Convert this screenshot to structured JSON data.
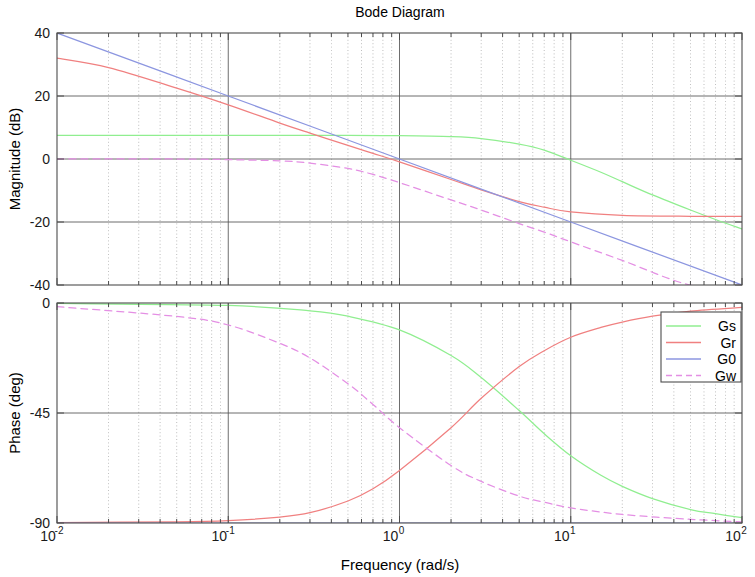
{
  "figure": {
    "title": "Bode Diagram",
    "width": 755,
    "height": 577,
    "background": "#ffffff"
  },
  "xaxis": {
    "label": "Frequency  (rad/s)",
    "scale": "log",
    "min": 0.01,
    "max": 100,
    "tick_mantissas": [
      "10",
      "10",
      "10",
      "10",
      "10"
    ],
    "tick_exponents": [
      "-2",
      "-1",
      "0",
      "1",
      "2"
    ],
    "tick_values": [
      0.01,
      0.1,
      1,
      10,
      100
    ],
    "grid": "on"
  },
  "panels": {
    "magnitude": {
      "ylabel": "Magnitude (dB)",
      "ymin": -40,
      "ymax": 40,
      "yticks": [
        "40",
        "20",
        "0",
        "-20",
        "-40"
      ],
      "ytick_values": [
        40,
        20,
        0,
        -20,
        -40
      ]
    },
    "phase": {
      "ylabel": "Phase (deg)",
      "ymin": -90,
      "ymax": 0,
      "yticks": [
        "0",
        "-45",
        "-90"
      ],
      "ytick_values": [
        0,
        -45,
        -90
      ]
    }
  },
  "legend": {
    "position": "top-right-of-phase-panel",
    "entries": [
      {
        "label": "Gs",
        "color": "#90ee90",
        "style": "solid"
      },
      {
        "label": "Gr",
        "color": "#f08080",
        "style": "solid"
      },
      {
        "label": "G0",
        "color": "#8c96e0",
        "style": "solid"
      },
      {
        "label": "Gw",
        "color": "#e48fe4",
        "style": "dashed"
      }
    ]
  },
  "chart_data": {
    "type": "line",
    "title": "Bode Diagram",
    "xlabel": "Frequency  (rad/s)",
    "xscale": "log",
    "xlim": [
      0.01,
      100
    ],
    "grid": true,
    "legend_position": "upper right",
    "subplots": [
      {
        "name": "magnitude",
        "ylabel": "Magnitude (dB)",
        "ylim": [
          -40,
          40
        ],
        "yticks": [
          40,
          20,
          0,
          -20,
          -40
        ],
        "series": [
          {
            "name": "Gs",
            "color": "#90ee90",
            "style": "solid",
            "x": [
              0.01,
              0.02,
              0.05,
              0.1,
              0.2,
              0.5,
              1,
              2,
              3,
              5,
              7,
              10,
              15,
              20,
              30,
              50,
              70,
              100
            ],
            "y": [
              7.5,
              7.5,
              7.5,
              7.5,
              7.5,
              7.5,
              7.4,
              7.1,
              6.5,
              4.7,
              2.8,
              -0.4,
              -4.2,
              -7.2,
              -11.4,
              -16.2,
              -19.2,
              -22.2
            ]
          },
          {
            "name": "Gr",
            "color": "#f08080",
            "style": "solid",
            "x": [
              0.01,
              0.02,
              0.05,
              0.1,
              0.2,
              0.3,
              0.5,
              0.7,
              1,
              2,
              3,
              5,
              7,
              10,
              20,
              50,
              100
            ],
            "y": [
              32.0,
              29.0,
              22.5,
              17.2,
              11.4,
              8.2,
              4.3,
              1.8,
              -0.9,
              -6.5,
              -9.8,
              -13.5,
              -15.3,
              -16.8,
              -17.9,
              -18.2,
              -18.2
            ]
          },
          {
            "name": "G0",
            "color": "#8c96e0",
            "style": "solid",
            "x": [
              0.01,
              0.1,
              1,
              10,
              100
            ],
            "y": [
              40,
              20,
              0,
              -20,
              -40
            ]
          },
          {
            "name": "Gw",
            "color": "#e48fe4",
            "style": "dashed",
            "x": [
              0.01,
              0.05,
              0.1,
              0.2,
              0.3,
              0.5,
              0.7,
              1,
              2,
              3,
              5,
              7,
              10,
              20,
              50,
              100
            ],
            "y": [
              0.0,
              0.0,
              -0.2,
              -0.6,
              -1.3,
              -3.0,
              -4.9,
              -7.5,
              -13.0,
              -16.2,
              -20.5,
              -23.2,
              -26.3,
              -32.2,
              -40.0,
              -40.0
            ]
          }
        ]
      },
      {
        "name": "phase",
        "ylabel": "Phase (deg)",
        "ylim": [
          -90,
          0
        ],
        "yticks": [
          0,
          -45,
          -90
        ],
        "series": [
          {
            "name": "Gs",
            "color": "#90ee90",
            "style": "solid",
            "x": [
              0.01,
              0.1,
              0.3,
              0.5,
              1,
              2,
              3,
              5,
              7,
              10,
              15,
              20,
              30,
              50,
              70,
              100
            ],
            "y": [
              -0.2,
              -1.0,
              -3.2,
              -5.4,
              -11.0,
              -21.5,
              -30.5,
              -44.0,
              -53.5,
              -62.5,
              -70.5,
              -75.0,
              -80.0,
              -84.5,
              -86.2,
              -87.8
            ]
          },
          {
            "name": "Gr",
            "color": "#f08080",
            "style": "solid",
            "x": [
              0.01,
              0.05,
              0.1,
              0.2,
              0.3,
              0.5,
              0.7,
              1,
              2,
              3,
              5,
              7,
              10,
              15,
              20,
              30,
              50,
              100
            ],
            "y": [
              -89.8,
              -89.5,
              -89.0,
              -87.6,
              -85.8,
              -81.0,
              -76.0,
              -68.5,
              -51.0,
              -39.0,
              -26.0,
              -19.5,
              -14.0,
              -10.0,
              -7.8,
              -5.4,
              -3.3,
              -1.8
            ]
          },
          {
            "name": "G0",
            "color": "#8c96e0",
            "style": "solid",
            "x": [
              0.01,
              0.1,
              1,
              10,
              100
            ],
            "y": [
              -90,
              -90,
              -90,
              -90,
              -90
            ]
          },
          {
            "name": "Gw",
            "color": "#e48fe4",
            "style": "dashed",
            "x": [
              0.01,
              0.05,
              0.1,
              0.2,
              0.3,
              0.5,
              0.7,
              1,
              2,
              3,
              5,
              7,
              10,
              20,
              50,
              100
            ],
            "y": [
              -1.5,
              -5.5,
              -9.0,
              -16.5,
              -22.5,
              -33.0,
              -41.5,
              -51.0,
              -66.5,
              -73.0,
              -79.0,
              -81.5,
              -83.8,
              -86.5,
              -88.5,
              -89.5
            ]
          }
        ]
      }
    ]
  }
}
